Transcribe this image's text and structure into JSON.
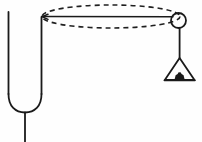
{
  "figure": {
    "background_color": "#fefefe",
    "ink_color": "#1a1a1a",
    "width": 202,
    "height": 142
  },
  "chart_data": {
    "type": "diagram",
    "xlabel": "",
    "ylabel": "",
    "xlim": [
      0,
      202
    ],
    "ylim": [
      0,
      142
    ],
    "grid": false,
    "legend": "none",
    "annotations": [],
    "elements": [
      {
        "name": "u-tube-left-wall",
        "kind": "line",
        "points": [
          [
            8.5,
            12
          ],
          [
            8.5,
            95
          ]
        ],
        "style": "solid",
        "stroke_width": 1.8
      },
      {
        "name": "u-tube-bend",
        "kind": "arc",
        "points": [
          [
            8.5,
            95
          ],
          [
            25,
            112
          ],
          [
            41.5,
            95
          ]
        ],
        "style": "solid",
        "stroke_width": 1.8
      },
      {
        "name": "u-tube-right-wall",
        "kind": "line",
        "points": [
          [
            41.5,
            16.5
          ],
          [
            41.5,
            95
          ]
        ],
        "style": "solid",
        "stroke_width": 1.8
      },
      {
        "name": "u-tube-stem",
        "kind": "line",
        "points": [
          [
            25,
            112
          ],
          [
            25,
            142
          ]
        ],
        "style": "solid",
        "stroke_width": 1.8
      },
      {
        "name": "horizontal-string",
        "kind": "line",
        "points": [
          [
            42,
            16.5
          ],
          [
            173,
            16.5
          ]
        ],
        "style": "solid",
        "stroke_width": 1.5
      },
      {
        "name": "circular-path-ellipse",
        "kind": "ellipse",
        "center": [
          111,
          16.5
        ],
        "rx": 69,
        "ry": 11.5,
        "style": "dashed",
        "dash_pattern": "5 4",
        "stroke_width": 1.6
      },
      {
        "name": "pulley-wheel",
        "kind": "circle",
        "center": [
          178.5,
          20.5
        ],
        "r": 7.5,
        "style": "solid",
        "stroke_width": 1.8,
        "fill": "none"
      },
      {
        "name": "hanging-string",
        "kind": "line",
        "points": [
          [
            179.5,
            28
          ],
          [
            179.5,
            58
          ]
        ],
        "style": "solid",
        "stroke_width": 1.8
      },
      {
        "name": "weight-hanger-triangle",
        "kind": "polygon",
        "points": [
          [
            179.5,
            58
          ],
          [
            194,
            80
          ],
          [
            165,
            80
          ]
        ],
        "style": "solid",
        "stroke_width": 1.8,
        "fill": "none"
      },
      {
        "name": "weight-hanger-base-bar",
        "kind": "line",
        "points": [
          [
            165.5,
            80.5
          ],
          [
            194,
            80.5
          ]
        ],
        "style": "solid",
        "stroke_width": 1.8
      },
      {
        "name": "weight-mass-block",
        "kind": "shape",
        "center": [
          179.5,
          76
        ],
        "width": 11,
        "height": 6,
        "style": "solid",
        "fill": "#1a1a1a"
      }
    ]
  }
}
